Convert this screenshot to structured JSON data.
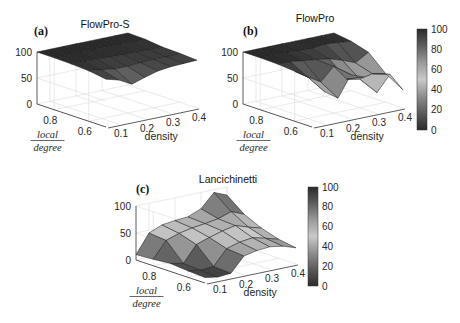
{
  "figure": {
    "colorbar_ticks": [
      "0",
      "20",
      "40",
      "60",
      "80",
      "100"
    ],
    "colormap": [
      "#2b2b2b",
      "#5a5a5a",
      "#8e8e8e",
      "#c9c9c9",
      "#9a9a9a",
      "#5e5e5e",
      "#2a2a2a"
    ]
  },
  "chart_data": [
    {
      "type": "surface",
      "panel": "(a)",
      "title": "FlowPro-S",
      "xlabel": "density",
      "ylabel": "local / degree",
      "zlabel": "",
      "x_ticks": [
        "0.1",
        "0.2",
        "0.3",
        "0.4"
      ],
      "y_ticks": [
        "0.8",
        "0.6"
      ],
      "z_ticks": [
        "0",
        "50",
        "100"
      ],
      "zlim": [
        0,
        100
      ],
      "x": [
        0.05,
        0.1,
        0.15,
        0.2,
        0.25,
        0.3,
        0.35,
        0.4
      ],
      "y": [
        0.9,
        0.8,
        0.7,
        0.6,
        0.5
      ],
      "z": [
        [
          100,
          100,
          100,
          100,
          100,
          100,
          100,
          100
        ],
        [
          100,
          100,
          100,
          100,
          100,
          100,
          99,
          99
        ],
        [
          99,
          99,
          98,
          97,
          96,
          96,
          95,
          95
        ],
        [
          97,
          94,
          90,
          90,
          92,
          93,
          93,
          94
        ],
        [
          92,
          85,
          72,
          80,
          87,
          90,
          91,
          92
        ]
      ],
      "colorbar": false
    },
    {
      "type": "surface",
      "panel": "(b)",
      "title": "FlowPro",
      "xlabel": "density",
      "ylabel": "local / degree",
      "zlabel": "",
      "x_ticks": [
        "0.1",
        "0.2",
        "0.3",
        "0.4"
      ],
      "y_ticks": [
        "0.8",
        "0.6"
      ],
      "z_ticks": [
        "0",
        "50",
        "100"
      ],
      "zlim": [
        0,
        100
      ],
      "x": [
        0.05,
        0.1,
        0.15,
        0.2,
        0.25,
        0.3,
        0.35,
        0.4
      ],
      "y": [
        0.9,
        0.8,
        0.7,
        0.6,
        0.5
      ],
      "z": [
        [
          100,
          100,
          100,
          100,
          100,
          100,
          100,
          100
        ],
        [
          100,
          100,
          100,
          98,
          97,
          100,
          98,
          95
        ],
        [
          99,
          98,
          95,
          92,
          88,
          80,
          70,
          85
        ],
        [
          96,
          80,
          65,
          90,
          60,
          55,
          60,
          55
        ],
        [
          92,
          62,
          45,
          85,
          75,
          40,
          70,
          35
        ]
      ],
      "colorbar": true,
      "colorbar_range": [
        0,
        100
      ]
    },
    {
      "type": "surface",
      "panel": "(c)",
      "title": "Lancichinetti",
      "xlabel": "density",
      "ylabel": "local / degree",
      "zlabel": "",
      "x_ticks": [
        "0.1",
        "0.2",
        "0.3",
        "0.4"
      ],
      "y_ticks": [
        "0.8",
        "0.6"
      ],
      "z_ticks": [
        "0",
        "50",
        "100"
      ],
      "zlim": [
        0,
        100
      ],
      "x": [
        0.05,
        0.1,
        0.15,
        0.2,
        0.25,
        0.3,
        0.35,
        0.4
      ],
      "y": [
        0.9,
        0.8,
        0.7,
        0.6,
        0.5
      ],
      "z": [
        [
          10,
          45,
          55,
          58,
          60,
          70,
          95,
          85
        ],
        [
          12,
          42,
          50,
          55,
          58,
          62,
          70,
          60
        ],
        [
          15,
          10,
          40,
          48,
          55,
          60,
          52,
          45
        ],
        [
          12,
          8,
          10,
          38,
          45,
          48,
          42,
          35
        ],
        [
          10,
          6,
          8,
          35,
          40,
          42,
          38,
          30
        ]
      ],
      "colorbar": true,
      "colorbar_range": [
        0,
        100
      ]
    }
  ]
}
